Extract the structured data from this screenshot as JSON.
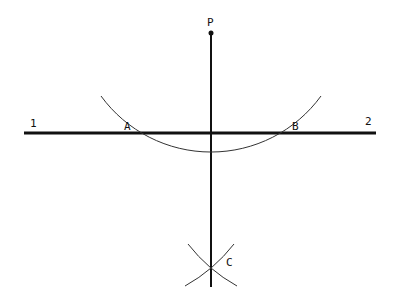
{
  "diagram": {
    "title": "",
    "line_color": "#111111",
    "arc_color": "#333333",
    "points": {
      "P": {
        "label": "P",
        "x": 211,
        "y": 33
      },
      "A": {
        "label": "A",
        "x": 121,
        "y": 133
      },
      "B": {
        "label": "B",
        "x": 301,
        "y": 133
      },
      "C": {
        "label": "C",
        "x": 211,
        "y": 266
      }
    },
    "line_labels": {
      "left": "1",
      "right": "2"
    },
    "horizontal_line": {
      "x1": 24,
      "x2": 376,
      "y": 133
    },
    "perpendicular": {
      "x": 211,
      "y1": 33,
      "y2": 287
    },
    "main_arc": {
      "center": "P",
      "radius": 136
    },
    "construction_arc_radius": 161
  }
}
